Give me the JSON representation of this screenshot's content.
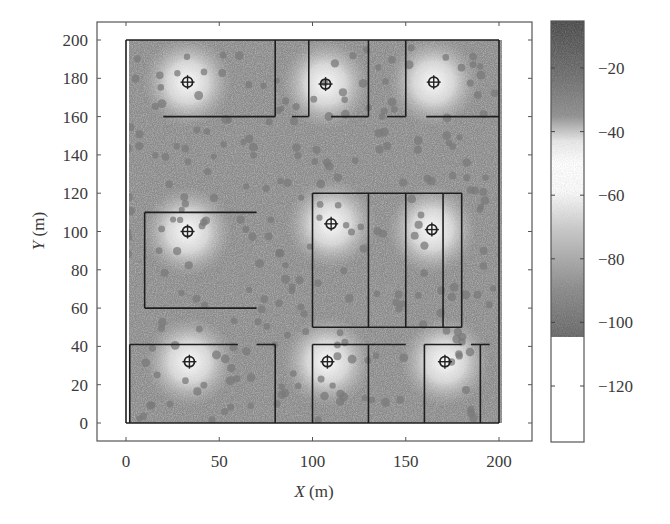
{
  "chart_data": {
    "type": "heatmap",
    "title": "",
    "xlabel": "X (m)",
    "ylabel": "Y (m)",
    "xlim": [
      -12,
      218
    ],
    "ylim": [
      -10,
      210
    ],
    "x_ticks": [
      0,
      50,
      100,
      150,
      200
    ],
    "y_ticks": [
      0,
      20,
      40,
      60,
      80,
      100,
      120,
      140,
      160,
      180,
      200
    ],
    "grid": false,
    "colorbar": {
      "ticks": [
        -20,
        -40,
        -60,
        -80,
        -100,
        -120
      ],
      "range": [
        -135,
        -5
      ],
      "description": "received signal strength; grayscale: dark near -10, white near -60, dark near -100, white below -105"
    },
    "access_points": [
      {
        "x": 33,
        "y": 178
      },
      {
        "x": 107,
        "y": 177
      },
      {
        "x": 165,
        "y": 178
      },
      {
        "x": 33,
        "y": 100
      },
      {
        "x": 110,
        "y": 104
      },
      {
        "x": 164,
        "y": 101
      },
      {
        "x": 34,
        "y": 32
      },
      {
        "x": 108,
        "y": 32
      },
      {
        "x": 171,
        "y": 32
      }
    ],
    "walls": [
      [
        [
          0,
          200
        ],
        [
          200,
          200
        ]
      ],
      [
        [
          0,
          200
        ],
        [
          0,
          0
        ]
      ],
      [
        [
          200,
          200
        ],
        [
          200,
          0
        ]
      ],
      [
        [
          0,
          0
        ],
        [
          200,
          0
        ]
      ],
      [
        [
          80,
          200
        ],
        [
          80,
          160
        ]
      ],
      [
        [
          20,
          160
        ],
        [
          80,
          160
        ]
      ],
      [
        [
          89,
          160
        ],
        [
          98,
          160
        ]
      ],
      [
        [
          98,
          200
        ],
        [
          98,
          160
        ]
      ],
      [
        [
          110,
          160
        ],
        [
          130,
          160
        ]
      ],
      [
        [
          130,
          200
        ],
        [
          130,
          160
        ]
      ],
      [
        [
          150,
          200
        ],
        [
          150,
          160
        ]
      ],
      [
        [
          140,
          160
        ],
        [
          150,
          160
        ]
      ],
      [
        [
          161,
          160
        ],
        [
          200,
          160
        ]
      ],
      [
        [
          10,
          110
        ],
        [
          70,
          110
        ]
      ],
      [
        [
          10,
          110
        ],
        [
          10,
          60
        ]
      ],
      [
        [
          10,
          60
        ],
        [
          70,
          60
        ]
      ],
      [
        [
          100,
          120
        ],
        [
          180,
          120
        ]
      ],
      [
        [
          100,
          120
        ],
        [
          100,
          50
        ]
      ],
      [
        [
          100,
          50
        ],
        [
          180,
          50
        ]
      ],
      [
        [
          180,
          120
        ],
        [
          180,
          50
        ]
      ],
      [
        [
          130,
          120
        ],
        [
          130,
          50
        ]
      ],
      [
        [
          150,
          120
        ],
        [
          150,
          50
        ]
      ],
      [
        [
          170,
          120
        ],
        [
          170,
          50
        ]
      ],
      [
        [
          2,
          41
        ],
        [
          60,
          41
        ]
      ],
      [
        [
          70,
          41
        ],
        [
          80,
          41
        ]
      ],
      [
        [
          80,
          41
        ],
        [
          80,
          0
        ]
      ],
      [
        [
          2,
          41
        ],
        [
          2,
          0
        ]
      ],
      [
        [
          100,
          41
        ],
        [
          130,
          41
        ]
      ],
      [
        [
          100,
          41
        ],
        [
          100,
          0
        ]
      ],
      [
        [
          130,
          41
        ],
        [
          130,
          0
        ]
      ],
      [
        [
          130,
          41
        ],
        [
          150,
          41
        ]
      ],
      [
        [
          160,
          41
        ],
        [
          180,
          41
        ]
      ],
      [
        [
          160,
          41
        ],
        [
          160,
          0
        ]
      ],
      [
        [
          190,
          41
        ],
        [
          190,
          0
        ]
      ],
      [
        [
          185,
          41
        ],
        [
          195,
          41
        ]
      ]
    ]
  }
}
